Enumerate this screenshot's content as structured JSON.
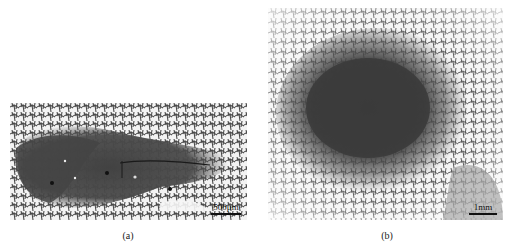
{
  "figure": {
    "panels": [
      {
        "id": "a",
        "caption": "(a)",
        "scale_bar": "500μm",
        "description": "Optical micrograph: dark elongated region within light dendritic/cellular microstructure, with a thin crack running through"
      },
      {
        "id": "b",
        "caption": "(b)",
        "scale_bar": "1mm",
        "description": "Optical micrograph: dark roughly elliptical region surrounded by gradient of dendritic microstructure"
      }
    ],
    "colors": {
      "dark_region": "#3a3a3a",
      "light_matrix": "#f2f2f2",
      "dendrite_lines": "#555555"
    }
  }
}
